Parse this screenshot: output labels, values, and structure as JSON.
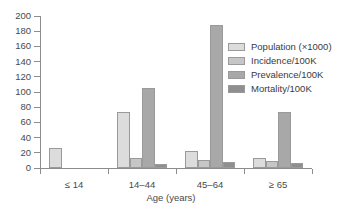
{
  "chart_data": {
    "type": "bar",
    "title": "",
    "xlabel": "Age (years)",
    "ylabel": "",
    "categories": [
      "≤ 14",
      "14–44",
      "45–64",
      "≥ 65"
    ],
    "ylim": [
      0,
      200
    ],
    "yticks": [
      0,
      20,
      40,
      60,
      80,
      100,
      120,
      140,
      160,
      180,
      200
    ],
    "grid": false,
    "legend_position": "top-right",
    "series": [
      {
        "name": "Population (×1000)",
        "color": "#dcdcdc",
        "values": [
          26,
          74,
          23,
          13
        ]
      },
      {
        "name": "Incidence/100K",
        "color": "#c6c6c6",
        "values": [
          0,
          13,
          10,
          9
        ]
      },
      {
        "name": "Prevalence/100K",
        "color": "#a8a8a8",
        "values": [
          0,
          105,
          188,
          74
        ]
      },
      {
        "name": "Mortality/100K",
        "color": "#8f8f8f",
        "values": [
          0,
          5,
          8,
          7
        ]
      }
    ]
  },
  "axis": {
    "line_color": "#8c8c8c",
    "tick_color": "#8c8c8c",
    "text_color": "#4a4a4a"
  }
}
